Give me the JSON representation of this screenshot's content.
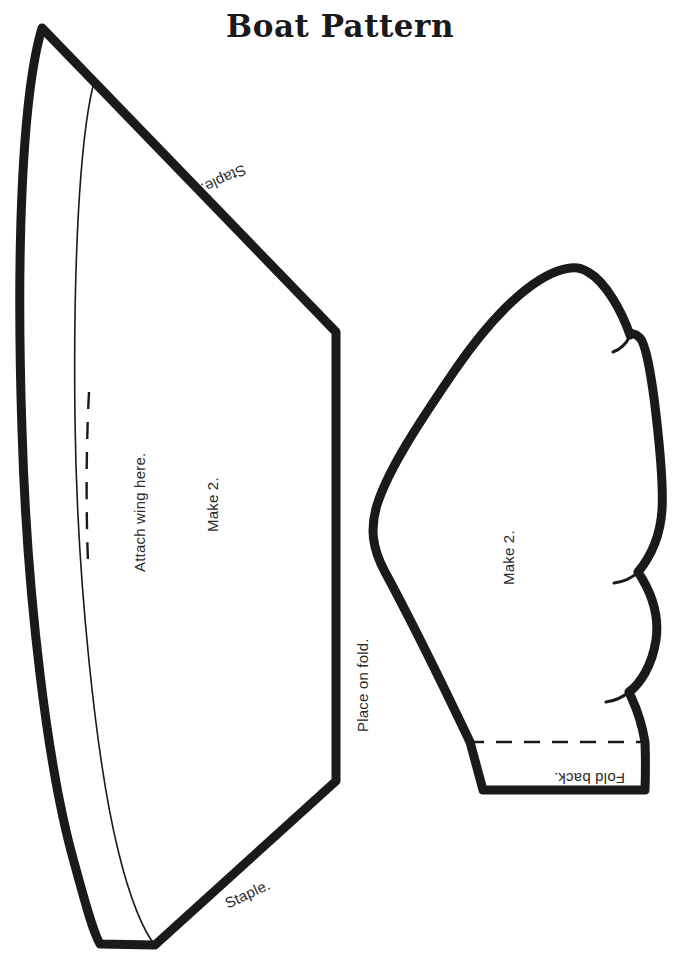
{
  "document": {
    "title": "Boat Pattern",
    "background_color": "#ffffff",
    "ink_color": "#1a1a1a",
    "width": 676,
    "height": 957
  },
  "hull_piece": {
    "name": "boat-hull-piece",
    "labels": {
      "staple_top": "Staple.",
      "attach_wing": "Attach wing here.",
      "make_two": "Make 2.",
      "place_on_fold": "Place on fold.",
      "staple_bottom": "Staple."
    }
  },
  "wing_piece": {
    "name": "boat-wing-piece",
    "labels": {
      "make_two": "Make 2.",
      "fold_back": "Fold back."
    }
  }
}
